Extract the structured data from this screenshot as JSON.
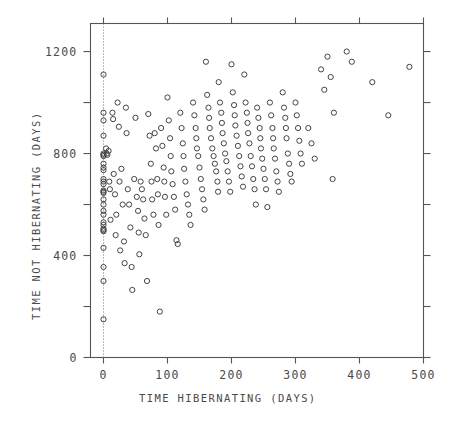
{
  "chart_data": {
    "type": "scatter",
    "title": "",
    "xlabel": "TIME HIBERNATING (DAYS)",
    "ylabel": "TIME NOT HIBERNATING (DAYS)",
    "xlim": [
      -20,
      500
    ],
    "ylim": [
      0,
      1310
    ],
    "xticks": [
      0,
      100,
      200,
      300,
      400,
      500
    ],
    "xtick_labels": [
      "0",
      "100",
      "200",
      "300",
      "400",
      "500"
    ],
    "yticks": [
      0,
      200,
      400,
      600,
      800,
      1000,
      1200
    ],
    "ytick_labels": [
      "0",
      "",
      "400",
      "",
      "800",
      "",
      "1200"
    ],
    "grid": false,
    "legend": null,
    "marker": "open-circle",
    "marker_color": "#444444",
    "reference_line": {
      "axis": "x",
      "value": 0,
      "style": "dotted"
    },
    "series": [
      {
        "name": "individuals",
        "points": [
          [
            0,
            1110
          ],
          [
            0,
            960
          ],
          [
            0,
            930
          ],
          [
            0,
            870
          ],
          [
            0,
            800
          ],
          [
            0,
            795
          ],
          [
            0,
            790
          ],
          [
            0,
            760
          ],
          [
            0,
            745
          ],
          [
            0,
            735
          ],
          [
            0,
            700
          ],
          [
            0,
            690
          ],
          [
            0,
            680
          ],
          [
            0,
            655
          ],
          [
            0,
            650
          ],
          [
            0,
            645
          ],
          [
            0,
            620
          ],
          [
            0,
            600
          ],
          [
            0,
            575
          ],
          [
            0,
            560
          ],
          [
            0,
            530
          ],
          [
            0,
            520
          ],
          [
            0,
            505
          ],
          [
            0,
            500
          ],
          [
            0,
            495
          ],
          [
            0,
            430
          ],
          [
            0,
            355
          ],
          [
            0,
            300
          ],
          [
            0,
            150
          ],
          [
            4,
            820
          ],
          [
            5,
            800
          ],
          [
            6,
            795
          ],
          [
            8,
            810
          ],
          [
            9,
            690
          ],
          [
            10,
            660
          ],
          [
            11,
            540
          ],
          [
            14,
            960
          ],
          [
            15,
            935
          ],
          [
            16,
            720
          ],
          [
            18,
            640
          ],
          [
            19,
            480
          ],
          [
            20,
            560
          ],
          [
            22,
            1000
          ],
          [
            24,
            905
          ],
          [
            25,
            690
          ],
          [
            26,
            420
          ],
          [
            28,
            740
          ],
          [
            30,
            600
          ],
          [
            32,
            455
          ],
          [
            33,
            370
          ],
          [
            35,
            980
          ],
          [
            36,
            880
          ],
          [
            38,
            660
          ],
          [
            40,
            600
          ],
          [
            42,
            510
          ],
          [
            44,
            355
          ],
          [
            45,
            265
          ],
          [
            48,
            700
          ],
          [
            50,
            940
          ],
          [
            52,
            630
          ],
          [
            54,
            575
          ],
          [
            55,
            490
          ],
          [
            56,
            405
          ],
          [
            58,
            690
          ],
          [
            60,
            660
          ],
          [
            62,
            620
          ],
          [
            64,
            545
          ],
          [
            66,
            480
          ],
          [
            68,
            300
          ],
          [
            70,
            955
          ],
          [
            72,
            870
          ],
          [
            74,
            760
          ],
          [
            75,
            690
          ],
          [
            76,
            620
          ],
          [
            78,
            560
          ],
          [
            80,
            880
          ],
          [
            82,
            820
          ],
          [
            84,
            700
          ],
          [
            85,
            640
          ],
          [
            86,
            520
          ],
          [
            88,
            180
          ],
          [
            90,
            900
          ],
          [
            92,
            830
          ],
          [
            94,
            745
          ],
          [
            95,
            690
          ],
          [
            96,
            630
          ],
          [
            98,
            560
          ],
          [
            100,
            1020
          ],
          [
            102,
            930
          ],
          [
            104,
            860
          ],
          [
            105,
            790
          ],
          [
            106,
            730
          ],
          [
            108,
            680
          ],
          [
            110,
            630
          ],
          [
            112,
            580
          ],
          [
            114,
            460
          ],
          [
            116,
            445
          ],
          [
            120,
            960
          ],
          [
            122,
            900
          ],
          [
            124,
            840
          ],
          [
            125,
            790
          ],
          [
            126,
            740
          ],
          [
            128,
            690
          ],
          [
            130,
            640
          ],
          [
            132,
            600
          ],
          [
            134,
            560
          ],
          [
            136,
            520
          ],
          [
            140,
            1000
          ],
          [
            142,
            950
          ],
          [
            144,
            900
          ],
          [
            145,
            860
          ],
          [
            146,
            820
          ],
          [
            148,
            790
          ],
          [
            150,
            745
          ],
          [
            152,
            700
          ],
          [
            154,
            660
          ],
          [
            156,
            620
          ],
          [
            158,
            580
          ],
          [
            160,
            1160
          ],
          [
            162,
            1030
          ],
          [
            164,
            980
          ],
          [
            165,
            940
          ],
          [
            166,
            900
          ],
          [
            168,
            860
          ],
          [
            170,
            820
          ],
          [
            172,
            790
          ],
          [
            174,
            760
          ],
          [
            176,
            730
          ],
          [
            178,
            690
          ],
          [
            179,
            650
          ],
          [
            180,
            1080
          ],
          [
            182,
            1000
          ],
          [
            184,
            960
          ],
          [
            185,
            920
          ],
          [
            186,
            880
          ],
          [
            188,
            840
          ],
          [
            190,
            800
          ],
          [
            192,
            770
          ],
          [
            194,
            730
          ],
          [
            196,
            690
          ],
          [
            198,
            650
          ],
          [
            200,
            1150
          ],
          [
            202,
            1040
          ],
          [
            204,
            990
          ],
          [
            205,
            950
          ],
          [
            206,
            910
          ],
          [
            208,
            870
          ],
          [
            210,
            830
          ],
          [
            212,
            790
          ],
          [
            214,
            750
          ],
          [
            216,
            710
          ],
          [
            218,
            670
          ],
          [
            220,
            1110
          ],
          [
            222,
            1000
          ],
          [
            224,
            960
          ],
          [
            225,
            920
          ],
          [
            226,
            880
          ],
          [
            228,
            840
          ],
          [
            230,
            790
          ],
          [
            232,
            750
          ],
          [
            234,
            700
          ],
          [
            236,
            660
          ],
          [
            238,
            600
          ],
          [
            240,
            980
          ],
          [
            242,
            940
          ],
          [
            244,
            900
          ],
          [
            245,
            860
          ],
          [
            246,
            820
          ],
          [
            248,
            780
          ],
          [
            250,
            740
          ],
          [
            252,
            700
          ],
          [
            254,
            660
          ],
          [
            256,
            590
          ],
          [
            260,
            1000
          ],
          [
            262,
            950
          ],
          [
            264,
            900
          ],
          [
            265,
            860
          ],
          [
            266,
            820
          ],
          [
            268,
            780
          ],
          [
            270,
            730
          ],
          [
            272,
            690
          ],
          [
            274,
            650
          ],
          [
            280,
            1040
          ],
          [
            282,
            980
          ],
          [
            284,
            940
          ],
          [
            285,
            900
          ],
          [
            286,
            860
          ],
          [
            288,
            800
          ],
          [
            290,
            760
          ],
          [
            292,
            720
          ],
          [
            294,
            690
          ],
          [
            300,
            1000
          ],
          [
            302,
            950
          ],
          [
            304,
            900
          ],
          [
            306,
            850
          ],
          [
            308,
            800
          ],
          [
            310,
            760
          ],
          [
            320,
            900
          ],
          [
            325,
            840
          ],
          [
            330,
            780
          ],
          [
            340,
            1130
          ],
          [
            345,
            1050
          ],
          [
            350,
            1180
          ],
          [
            355,
            1100
          ],
          [
            358,
            700
          ],
          [
            360,
            960
          ],
          [
            380,
            1200
          ],
          [
            388,
            1160
          ],
          [
            420,
            1080
          ],
          [
            445,
            950
          ],
          [
            478,
            1140
          ]
        ]
      }
    ]
  },
  "axes": {
    "x_tick_label_0": "0",
    "x_tick_label_1": "100",
    "x_tick_label_2": "200",
    "x_tick_label_3": "300",
    "x_tick_label_4": "400",
    "x_tick_label_5": "500",
    "y_tick_label_0": "0",
    "y_tick_label_1": "400",
    "y_tick_label_2": "800",
    "y_tick_label_3": "1200"
  }
}
